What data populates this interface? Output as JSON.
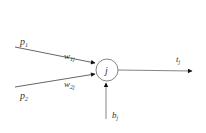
{
  "diagram": {
    "type": "single-neuron",
    "stroke_color": "#444444",
    "node": {
      "label": "j"
    },
    "inputs": [
      {
        "id": "p1",
        "label": "p",
        "label_sub": "1",
        "weight": "w",
        "weight_sub": "1j"
      },
      {
        "id": "p2",
        "label": "p",
        "label_sub": "2",
        "weight": "w",
        "weight_sub": "2j"
      }
    ],
    "bias": {
      "label": "b",
      "label_sub": "j"
    },
    "output": {
      "label": "t",
      "label_sub": "j"
    }
  }
}
